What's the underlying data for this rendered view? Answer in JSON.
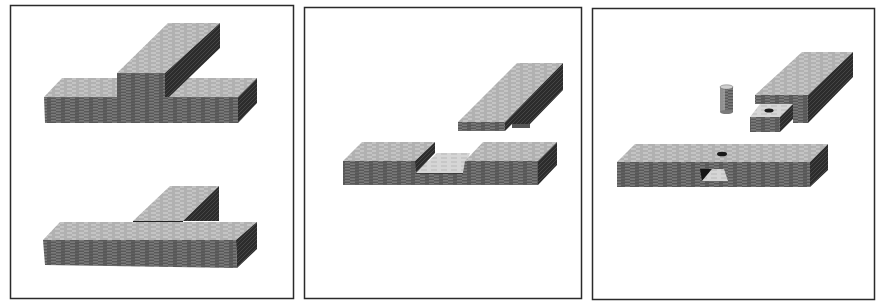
{
  "figure": {
    "panels": [
      {
        "id": "panel-1",
        "subject": "Lap joints: board laid over board (top) and housed/lap joint (bottom)"
      },
      {
        "id": "panel-2",
        "subject": "Cross-halving joint: notched board with matching upper board"
      },
      {
        "id": "panel-3",
        "subject": "Pinned mortise and tenon joint with dowel"
      }
    ]
  },
  "colors": {
    "background": "#ffffff",
    "frame": "#2a2a2a",
    "top_face": "#bdbdbd",
    "front_face": "#6e6e6e",
    "side_face": "#2e2e2e",
    "hole": "#1a1a1a",
    "light_face": "#d4d4d4"
  }
}
